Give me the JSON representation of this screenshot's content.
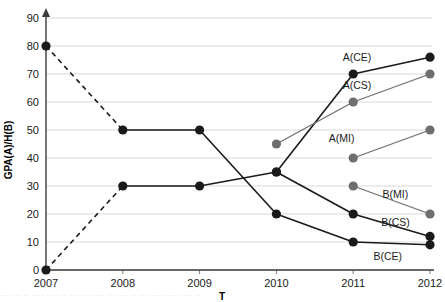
{
  "chart_data": {
    "type": "line",
    "title": "",
    "xlabel": "T",
    "ylabel": "GPA(A)/H(B)",
    "x": [
      2007,
      2008,
      2009,
      2010,
      2011,
      2012
    ],
    "xticklabels": [
      "2007",
      "2008",
      "2009",
      "2010",
      "2011",
      "2012"
    ],
    "yticks": [
      0,
      10,
      20,
      30,
      40,
      50,
      60,
      70,
      80,
      90
    ],
    "yticklabels": [
      "0",
      "10",
      "20",
      "30",
      "40",
      "50",
      "60",
      "70",
      "80",
      "90"
    ],
    "ylim": [
      0,
      90
    ],
    "xlim": [
      2007,
      2012
    ],
    "grid": true,
    "legend_position": "inline-right-labels",
    "series": [
      {
        "name": "A(CE)",
        "label": "A(CE)",
        "color": "#1a1a1a",
        "marker": "circle",
        "x": [
          2007,
          2008,
          2009,
          2010,
          2011,
          2012
        ],
        "values": [
          0,
          30,
          30,
          35,
          70,
          76
        ],
        "note": "rising black series; dashed from 2007 to 2008"
      },
      {
        "name": "A(CS)",
        "label": "A(CS)",
        "color": "#6e6e6e",
        "marker": "circle",
        "x": [
          2010,
          2011,
          2012
        ],
        "values": [
          45,
          60,
          70
        ]
      },
      {
        "name": "A(MI)",
        "label": "A(MI)",
        "color": "#6e6e6e",
        "marker": "circle",
        "x": [
          2011,
          2012
        ],
        "values": [
          40,
          50
        ]
      },
      {
        "name": "B(MI)",
        "label": "B(MI)",
        "color": "#6e6e6e",
        "marker": "circle",
        "x": [
          2011,
          2012
        ],
        "values": [
          30,
          20
        ]
      },
      {
        "name": "B(CS)",
        "label": "B(CS)",
        "color": "#1a1a1a",
        "marker": "circle",
        "x": [
          2010,
          2011,
          2012
        ],
        "values": [
          35,
          20,
          12
        ]
      },
      {
        "name": "B(CE)",
        "label": "B(CE)",
        "color": "#1a1a1a",
        "marker": "circle",
        "x": [
          2007,
          2008,
          2009,
          2010,
          2011,
          2012
        ],
        "values": [
          80,
          50,
          50,
          20,
          10,
          9
        ],
        "note": "falling black series; dashed from 2007 to 2008"
      }
    ],
    "annotations": [
      {
        "text": "A(CE)",
        "x": 2011.05,
        "y": 76
      },
      {
        "text": "A(CS)",
        "x": 2011.05,
        "y": 66
      },
      {
        "text": "A(MI)",
        "x": 2010.85,
        "y": 47
      },
      {
        "text": "B(MI)",
        "x": 2011.55,
        "y": 27
      },
      {
        "text": "B(CS)",
        "x": 2011.55,
        "y": 17
      },
      {
        "text": "B(CE)",
        "x": 2011.45,
        "y": 5
      }
    ]
  },
  "caption": {
    "text": "··· ··· ·· ···· ···· ·· ·· ··· ····· ·· ···· ·· ·· ····· ···· ···· ···"
  }
}
